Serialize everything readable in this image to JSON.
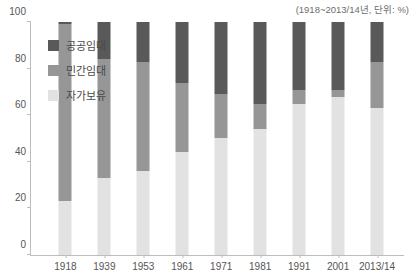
{
  "chart_note": "(1918~2013/14년, 단위: %)",
  "legend": {
    "position": "inside-top-left",
    "items": [
      {
        "label": "공공임대",
        "color": "#595959",
        "key": "public_rental"
      },
      {
        "label": "민간임대",
        "color": "#969696",
        "key": "private_rental"
      },
      {
        "label": "자가보유",
        "color": "#e2e2e2",
        "key": "owner_occupied"
      }
    ]
  },
  "chart_data": {
    "type": "bar",
    "stacked": true,
    "title": "",
    "subtitle": "",
    "xlabel": "",
    "ylabel": "",
    "ylim": [
      0,
      100
    ],
    "yticks": [
      0,
      20,
      40,
      60,
      80,
      100
    ],
    "grid": false,
    "legend_position": "inside-top-left",
    "unit": "%",
    "period": "1918~2013/14",
    "categories": [
      "1918",
      "1939",
      "1953",
      "1961",
      "1971",
      "1981",
      "1991",
      "2001",
      "2013/14"
    ],
    "series": [
      {
        "name": "자가보유",
        "color": "#e2e2e2",
        "values": [
          23,
          33,
          36,
          44,
          50,
          54,
          65,
          68,
          63
        ]
      },
      {
        "name": "민간임대",
        "color": "#969696",
        "values": [
          76,
          51,
          47,
          30,
          19,
          11,
          6,
          3,
          20
        ]
      },
      {
        "name": "공공임대",
        "color": "#595959",
        "values": [
          1,
          16,
          17,
          26,
          31,
          35,
          29,
          29,
          17
        ]
      }
    ]
  }
}
